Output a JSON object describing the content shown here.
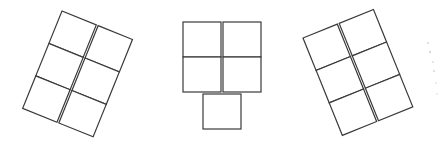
{
  "diagram": {
    "stroke_color": "#3a3a3a",
    "background": "#ffffff",
    "figures": [
      {
        "id": "left",
        "layout": "2 columns x 3 rows",
        "rotation_deg": 22,
        "origin": [
          62,
          11
        ],
        "cell_w": 37,
        "cell_h": 35,
        "col_gap": 2,
        "cells": [
          [
            0,
            0
          ],
          [
            1,
            0
          ],
          [
            0,
            1
          ],
          [
            1,
            1
          ],
          [
            0,
            2
          ],
          [
            1,
            2
          ]
        ]
      },
      {
        "id": "center",
        "layout": "2 columns x 2 rows plus 1 centered cell below",
        "rotation_deg": 0,
        "cells_px": [
          [
            183,
            22,
            38,
            35
          ],
          [
            223,
            22,
            38,
            35
          ],
          [
            183,
            57,
            38,
            35
          ],
          [
            223,
            57,
            38,
            35
          ],
          [
            203,
            94,
            38,
            35
          ]
        ]
      },
      {
        "id": "right",
        "layout": "2 columns x 3 rows",
        "rotation_deg": -22,
        "origin": [
          303,
          38
        ],
        "cell_w": 37,
        "cell_h": 35,
        "col_gap": 2,
        "cells": [
          [
            0,
            0
          ],
          [
            1,
            0
          ],
          [
            0,
            1
          ],
          [
            1,
            1
          ],
          [
            0,
            2
          ],
          [
            1,
            2
          ]
        ]
      }
    ]
  }
}
